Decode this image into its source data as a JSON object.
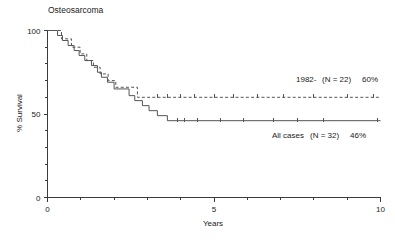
{
  "figure": {
    "title": "Osteosarcoma",
    "background_color": "#ffffff",
    "line_color": "#555555",
    "axis_color": "#3b3b3b"
  },
  "axes": {
    "x_label": "Years",
    "x_ticklabels": [
      "0",
      "5",
      "10"
    ],
    "x_tick_values": [
      0,
      5,
      10
    ],
    "x_minor_ticks": [
      1,
      2,
      3,
      4,
      6,
      7,
      8,
      9
    ],
    "y_label": "% Survival",
    "y_ticklabels": [
      "100",
      "50",
      "0"
    ],
    "y_tick_values": [
      100,
      50,
      0
    ],
    "y_minor_ticks": [
      10,
      20,
      30,
      40,
      60,
      70,
      80,
      90
    ]
  },
  "annotations": {
    "series_1982_label": "1982-",
    "series_1982_n": "(N = 22)",
    "series_1982_pct": "60%",
    "all_cases_label": "All cases",
    "all_cases_n": "(N = 32)",
    "all_cases_pct": "46%"
  },
  "chart_data": {
    "type": "line",
    "title": "Osteosarcoma",
    "subtitle": "",
    "xlabel": "Years",
    "ylabel": "% Survival",
    "xlim": [
      0,
      10
    ],
    "ylim": [
      0,
      100
    ],
    "grid": false,
    "legend_position": "inline-right-annotations",
    "step_style": "post",
    "series": [
      {
        "name": "All cases (N = 32) 46%",
        "style": "solid",
        "n": 32,
        "final_survival_pct": 46,
        "points": [
          [
            0.0,
            100
          ],
          [
            0.3,
            100
          ],
          [
            0.3,
            97
          ],
          [
            0.45,
            97
          ],
          [
            0.45,
            94
          ],
          [
            0.62,
            94
          ],
          [
            0.62,
            91
          ],
          [
            0.8,
            91
          ],
          [
            0.8,
            88
          ],
          [
            0.95,
            88
          ],
          [
            0.95,
            85
          ],
          [
            1.12,
            85
          ],
          [
            1.12,
            82
          ],
          [
            1.32,
            82
          ],
          [
            1.32,
            79
          ],
          [
            1.5,
            79
          ],
          [
            1.5,
            75
          ],
          [
            1.62,
            75
          ],
          [
            1.62,
            72
          ],
          [
            1.8,
            72
          ],
          [
            1.8,
            69
          ],
          [
            2.0,
            69
          ],
          [
            2.0,
            65
          ],
          [
            2.45,
            65
          ],
          [
            2.45,
            61
          ],
          [
            2.62,
            61
          ],
          [
            2.62,
            58
          ],
          [
            2.85,
            58
          ],
          [
            2.85,
            55
          ],
          [
            3.05,
            55
          ],
          [
            3.05,
            52
          ],
          [
            3.3,
            52
          ],
          [
            3.3,
            49
          ],
          [
            3.6,
            49
          ],
          [
            3.6,
            46
          ],
          [
            10.0,
            46
          ]
        ],
        "censored_times": [
          3.9,
          4.1,
          4.5,
          5.2,
          5.9,
          6.8,
          7.5,
          8.3,
          9.9
        ]
      },
      {
        "name": "1982- (N = 22) 60%",
        "style": "dashed",
        "n": 22,
        "final_survival_pct": 60,
        "points": [
          [
            0.0,
            100
          ],
          [
            0.42,
            100
          ],
          [
            0.42,
            95
          ],
          [
            0.72,
            95
          ],
          [
            0.72,
            90
          ],
          [
            0.98,
            90
          ],
          [
            0.98,
            86
          ],
          [
            1.18,
            86
          ],
          [
            1.18,
            82
          ],
          [
            1.38,
            82
          ],
          [
            1.38,
            78
          ],
          [
            1.58,
            78
          ],
          [
            1.58,
            74
          ],
          [
            1.82,
            74
          ],
          [
            1.82,
            70
          ],
          [
            2.05,
            70
          ],
          [
            2.05,
            66
          ],
          [
            2.7,
            66
          ],
          [
            2.7,
            60
          ],
          [
            10.0,
            60
          ]
        ],
        "censored_times": [
          3.3,
          3.6,
          4.0,
          4.4,
          5.0,
          5.6,
          6.3,
          7.1,
          8.0,
          9.0,
          9.8
        ]
      }
    ]
  }
}
